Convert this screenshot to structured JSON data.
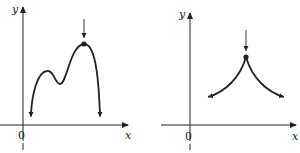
{
  "graphs": [
    {
      "name": "left-graph",
      "y_label": "y",
      "x_label": "x",
      "origin_label": "0",
      "description": "Curve with local max, local min, and absolute maximum marked by arrow and dot"
    },
    {
      "name": "right-graph",
      "y_label": "y",
      "x_label": "x",
      "origin_label": "0",
      "description": "Cusp-shaped curve with maximum at cusp marked by arrow and dot"
    }
  ],
  "colors": {
    "ink": "#222222",
    "background": "#ffffff"
  }
}
